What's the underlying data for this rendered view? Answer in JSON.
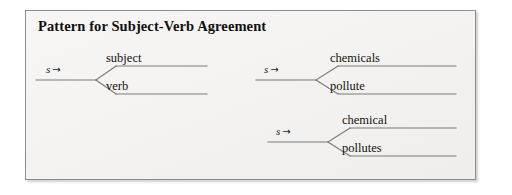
{
  "figure": {
    "title": "Pattern for Subject-Verb Agreement",
    "panel_background": "#f5f4f2",
    "border_color": "#8d8d8d",
    "line_color": "#7b7b7b",
    "text_color": "#14120f"
  },
  "diagrams": [
    {
      "id": "subject-verb",
      "source": {
        "symbol": "s",
        "arrow": "→"
      },
      "top_branch_label": "subject",
      "bottom_branch_label": "verb"
    },
    {
      "id": "plural-example",
      "source": {
        "symbol": "s",
        "arrow": "→"
      },
      "top_branch_label": "chemicals",
      "bottom_branch_label": "pollute"
    },
    {
      "id": "singular-example",
      "source": {
        "symbol": "s",
        "arrow": "→"
      },
      "top_branch_label": "chemical",
      "bottom_branch_label": "pollutes"
    }
  ]
}
